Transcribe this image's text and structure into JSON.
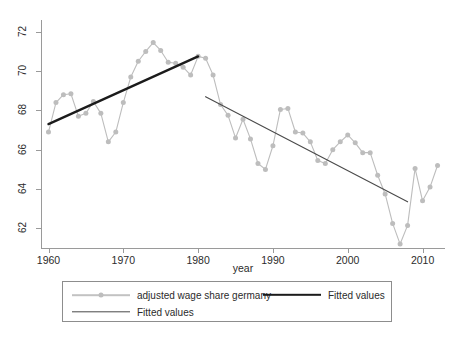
{
  "chart_data": {
    "type": "line",
    "title": "",
    "xlabel": "year",
    "ylabel": "",
    "xlim": [
      1959,
      2013
    ],
    "ylim": [
      61,
      72.6
    ],
    "xticks": [
      1960,
      1970,
      1980,
      1990,
      2000,
      2010
    ],
    "yticks": [
      62,
      64,
      66,
      68,
      70,
      72
    ],
    "grid": false,
    "legend_position": "bottom",
    "series": [
      {
        "name": "adjusted wage share germany",
        "style": "line-with-markers",
        "color": "#bdbdbd",
        "x": [
          1960,
          1961,
          1962,
          1963,
          1964,
          1965,
          1966,
          1967,
          1968,
          1969,
          1970,
          1971,
          1972,
          1973,
          1974,
          1975,
          1976,
          1977,
          1978,
          1979,
          1980,
          1981,
          1982,
          1983,
          1984,
          1985,
          1986,
          1987,
          1988,
          1989,
          1990,
          1991,
          1992,
          1993,
          1994,
          1995,
          1996,
          1997,
          1998,
          1999,
          2000,
          2001,
          2002,
          2003,
          2004,
          2005,
          2006,
          2007,
          2008,
          2009,
          2010,
          2011,
          2012
        ],
        "values": [
          66.9,
          68.4,
          68.8,
          68.85,
          67.7,
          67.85,
          68.45,
          67.85,
          66.4,
          66.9,
          68.4,
          69.7,
          70.5,
          71.0,
          71.45,
          71.05,
          70.45,
          70.4,
          70.2,
          69.8,
          70.75,
          70.65,
          69.8,
          68.3,
          67.75,
          66.6,
          67.55,
          66.55,
          65.3,
          65.0,
          66.2,
          68.05,
          68.1,
          66.9,
          66.85,
          66.4,
          65.45,
          65.3,
          66.0,
          66.4,
          66.75,
          66.35,
          65.85,
          65.85,
          64.7,
          63.75,
          62.25,
          61.2,
          62.15,
          65.05,
          63.4,
          64.1,
          65.2
        ]
      },
      {
        "name": "Fitted values",
        "style": "thick-line",
        "color": "#1b1b1b",
        "x": [
          1960,
          1980
        ],
        "values": [
          67.3,
          70.75
        ]
      },
      {
        "name": "Fitted values",
        "style": "thin-line",
        "color": "#4a4a4a",
        "x": [
          1981,
          2008
        ],
        "values": [
          68.7,
          63.35
        ]
      }
    ]
  },
  "axes": {
    "x_title": "year",
    "x_tick_labels": [
      "1960",
      "1970",
      "1980",
      "1990",
      "2000",
      "2010"
    ],
    "y_tick_labels": [
      "62",
      "64",
      "66",
      "68",
      "70",
      "72"
    ]
  },
  "legend": {
    "entries": [
      {
        "label": "adjusted wage share germany",
        "style": "line-with-markers"
      },
      {
        "label": "Fitted values",
        "style": "thick-line"
      },
      {
        "label": "Fitted values",
        "style": "thin-line"
      }
    ]
  },
  "colors": {
    "series_marker": "#bdbdbd",
    "fit_thick": "#1b1b1b",
    "fit_thin": "#4a4a4a",
    "axis": "#9a9a9a",
    "text": "#2b2b2b",
    "background": "#ffffff"
  }
}
